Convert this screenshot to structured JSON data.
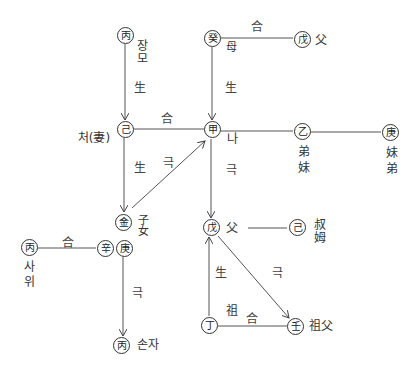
{
  "diagram": {
    "nodes": {
      "byeong_top": {
        "char": "丙",
        "label": "장모"
      },
      "gye": {
        "char": "癸",
        "label": "母"
      },
      "mu_top": {
        "char": "戊",
        "label": "父"
      },
      "gi_wife": {
        "char": "己",
        "label": "처(妻)"
      },
      "gap_self": {
        "char": "甲",
        "label": "나"
      },
      "eul": {
        "char": "乙",
        "label": "弟妹"
      },
      "gyeong_right": {
        "char": "庚",
        "label": "妹弟"
      },
      "geum": {
        "char": "金",
        "label": "子女"
      },
      "sin": {
        "char": "辛"
      },
      "gyeong_mid": {
        "char": "庚"
      },
      "byeong_left": {
        "char": "丙",
        "label": "사위"
      },
      "byeong_bottom": {
        "char": "丙",
        "label": "손자"
      },
      "mu_mid": {
        "char": "戊",
        "label": "父"
      },
      "gi_right": {
        "char": "己",
        "label": "叔姆"
      },
      "jeong": {
        "char": "丁",
        "label": "祖"
      },
      "im": {
        "char": "壬",
        "label": "祖父"
      }
    },
    "edges": [
      {
        "from": "byeong_top",
        "to": "gi_wife",
        "label": "生",
        "arrow": true
      },
      {
        "from": "gye",
        "to": "mu_top",
        "label": "合",
        "arrow": false
      },
      {
        "from": "gye",
        "to": "gap_self",
        "label": "生",
        "arrow": true
      },
      {
        "from": "gi_wife",
        "to": "gap_self",
        "label": "合",
        "arrow": false
      },
      {
        "from": "gap_self",
        "to": "eul",
        "arrow": false
      },
      {
        "from": "eul",
        "to": "gyeong_right",
        "arrow": false
      },
      {
        "from": "gi_wife",
        "to": "geum",
        "label": "生",
        "arrow": true
      },
      {
        "from": "geum",
        "to": "gap_self",
        "label": "극",
        "arrow": true
      },
      {
        "from": "gap_self",
        "to": "mu_mid",
        "label": "극",
        "arrow": true
      },
      {
        "from": "byeong_left",
        "to": "sin",
        "label": "合",
        "arrow": false
      },
      {
        "from": "gyeong_mid",
        "to": "byeong_bottom",
        "label": "극",
        "arrow": true
      },
      {
        "from": "mu_mid",
        "to": "gi_right",
        "arrow": false
      },
      {
        "from": "jeong",
        "to": "mu_mid",
        "label": "生",
        "arrow": true
      },
      {
        "from": "mu_mid",
        "to": "im",
        "label": "극",
        "arrow": true
      },
      {
        "from": "jeong",
        "to": "im",
        "label": "合",
        "arrow": false
      }
    ]
  }
}
